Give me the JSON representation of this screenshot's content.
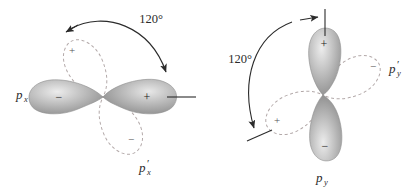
{
  "figure": {
    "background": "#ffffff",
    "solid_lobe_color": "#9a9a9a",
    "dashed_lobe_color": "#b0a8a8",
    "ink_color": "#2b2b2b"
  },
  "diagrams": [
    {
      "id": "left",
      "orbital_label": "p",
      "orbital_subscript": "x",
      "rotated_label": "p",
      "rotated_prime": "′",
      "rotated_subscript": "x",
      "angle_label": "120°",
      "solid_orientation": "horizontal",
      "solid_lobes": [
        {
          "position": "left",
          "sign": "−"
        },
        {
          "position": "right",
          "sign": "+"
        }
      ],
      "dashed_lobes": [
        {
          "position": "upper-left",
          "sign": "+"
        },
        {
          "position": "lower-right",
          "sign": "−"
        }
      ],
      "reference_tick": "horizontal",
      "arrows": [
        {
          "name": "arc-start-arrow",
          "points_to": "dashed-upper-lobe-axis"
        },
        {
          "name": "arc-end-arrow",
          "points_to": "horizontal-reference-tick"
        }
      ]
    },
    {
      "id": "right",
      "orbital_label": "p",
      "orbital_subscript": "y",
      "rotated_label": "p",
      "rotated_prime": "′",
      "rotated_subscript": "y",
      "angle_label": "120°",
      "solid_orientation": "vertical",
      "solid_lobes": [
        {
          "position": "top",
          "sign": "+"
        },
        {
          "position": "bottom",
          "sign": "−"
        }
      ],
      "dashed_lobes": [
        {
          "position": "right",
          "sign": "−"
        },
        {
          "position": "lower-left",
          "sign": "+"
        }
      ],
      "reference_tick": "vertical",
      "arrows": [
        {
          "name": "arc-start-arrow",
          "points_to": "vertical-reference-tick"
        },
        {
          "name": "arc-end-arrow",
          "points_to": "dashed-lower-left-lobe-axis"
        }
      ]
    }
  ]
}
